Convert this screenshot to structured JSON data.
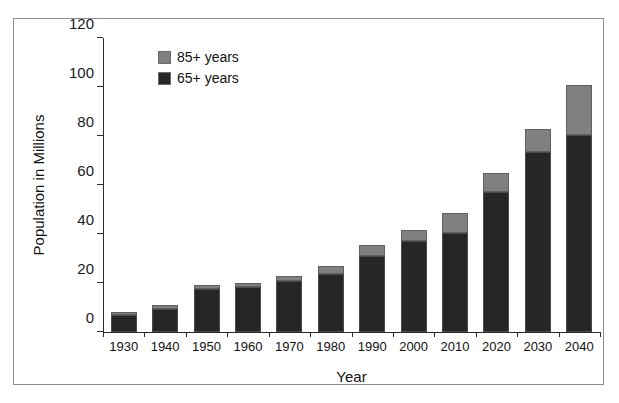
{
  "chart_data": {
    "type": "bar",
    "subtype": "stacked-bar",
    "title": "",
    "xlabel": "Year",
    "ylabel": "Population in Millions",
    "categories": [
      "1930",
      "1940",
      "1950",
      "1960",
      "1970",
      "1980",
      "1990",
      "2000",
      "2010",
      "2020",
      "2030",
      "2040"
    ],
    "series": [
      {
        "name": "65+ years",
        "color": "#262626",
        "stack_order": 0,
        "values": [
          7,
          9.5,
          17.5,
          18.5,
          21,
          23.5,
          31,
          37,
          40.5,
          57,
          73.5,
          80.5
        ]
      },
      {
        "name": "85+ years",
        "color": "#808080",
        "stack_order": 1,
        "values": [
          1,
          1.5,
          1.5,
          1.5,
          2,
          3.5,
          4.5,
          4.5,
          8,
          8,
          9.5,
          20.5
        ]
      }
    ],
    "totals": [
      8,
      11,
      19,
      20,
      23,
      27,
      35.5,
      41.5,
      48.5,
      65,
      83,
      101
    ],
    "ylim": [
      0,
      120
    ],
    "ytick_values": [
      0,
      20,
      40,
      60,
      80,
      100,
      120
    ],
    "ytick_labels": [
      "0",
      "20",
      "40",
      "60",
      "80",
      "100",
      "120"
    ],
    "grid": false,
    "legend_position": "top-left-inside",
    "legend_entries": [
      "85+ years",
      "65+ years"
    ]
  },
  "legend": {
    "items": [
      {
        "label": "85+ years",
        "color": "#808080"
      },
      {
        "label": "65+ years",
        "color": "#262626"
      }
    ]
  },
  "axes": {
    "y_title": "Population in Millions",
    "x_title": "Year"
  }
}
